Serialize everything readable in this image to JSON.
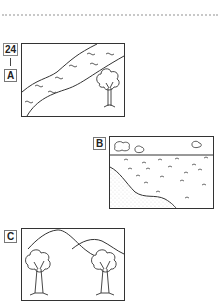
{
  "question": {
    "number": "24",
    "separator": "|"
  },
  "panels": [
    {
      "label": "A",
      "scene": "river-with-tree",
      "icon": "river-landscape-icon"
    },
    {
      "label": "B",
      "scene": "lake-shore-with-clouds",
      "icon": "lake-landscape-icon"
    },
    {
      "label": "C",
      "scene": "hills-with-two-trees",
      "icon": "hills-landscape-icon"
    }
  ]
}
